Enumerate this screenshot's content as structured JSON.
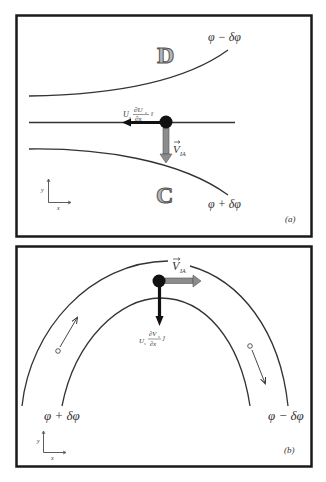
{
  "figure": {
    "panel_a": {
      "tag": "(a)",
      "upper_streamline_label": "φ − δφ",
      "lower_streamline_label": "φ + δφ",
      "region_upper": "D",
      "region_lower": "C",
      "advection_term": {
        "U": "U",
        "sub": "s",
        "num": "∂U",
        "num_sub": "s",
        "den": "∂x",
        "unit": "î"
      },
      "velocity_label": {
        "V": "V",
        "sub": "IA"
      },
      "axes": {
        "x": "x",
        "y": "y"
      }
    },
    "panel_b": {
      "tag": "(b)",
      "left_streamline_label": "φ + δφ",
      "right_streamline_label": "φ − δφ",
      "advection_term": {
        "U": "U",
        "sub": "s",
        "num": "∂V",
        "num_sub": "s",
        "den": "∂x",
        "unit": "ĵ"
      },
      "velocity_label": {
        "V": "V",
        "sub": "IA"
      },
      "axes": {
        "x": "x",
        "y": "y"
      }
    },
    "colors": {
      "frame": "#1a1a1a",
      "streamline": "#333333",
      "dot": "#111111",
      "black_arrow": "#111111",
      "gray_arrow": "#8c8c8c",
      "letter_fill": "#b8b8b8"
    }
  }
}
